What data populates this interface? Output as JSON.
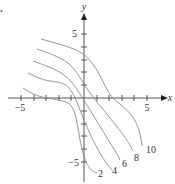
{
  "figure": {
    "type": "contour_plot",
    "axes": {
      "x_label": "x",
      "y_label": "y",
      "x_ticks": [
        -5,
        -4,
        -3,
        -2,
        -1,
        0,
        1,
        2,
        3,
        4,
        5
      ],
      "y_ticks": [
        -5,
        -4,
        -3,
        -2,
        -1,
        0,
        1,
        2,
        3,
        4,
        5
      ],
      "x_tick_labels": {
        "neg": "−5",
        "pos": "5"
      },
      "y_tick_labels": {
        "neg": "−5",
        "pos": "5"
      }
    },
    "contours": [
      {
        "level": "2",
        "label": "2"
      },
      {
        "level": "4",
        "label": "4"
      },
      {
        "level": "6",
        "label": "6"
      },
      {
        "level": "8",
        "label": "8"
      },
      {
        "level": "10",
        "label": "10"
      }
    ],
    "colors": {
      "curve": "#8a8a8a",
      "axis": "#555555",
      "text": "#333333"
    }
  }
}
